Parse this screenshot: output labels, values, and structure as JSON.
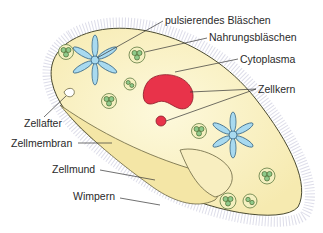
{
  "diagram": {
    "labels": {
      "pulsierendes_blaeschen": "pulsierendes Bläschen",
      "nahrungsblaeschen": "Nahrungsbläschen",
      "cytoplasma": "Cytoplasma",
      "zellkern": "Zellkern",
      "zellafter": "Zellafter",
      "zellmembran": "Zellmembran",
      "zellmund": "Zellmund",
      "wimpern": "Wimpern"
    },
    "colors": {
      "cytoplasm": "#fbf5c8",
      "nucleus": "#e8334a",
      "vacuole": "#a8daf0",
      "food_vacuole": "#8fc98a",
      "outline": "#5a5a3a",
      "cilia": "#c8c8dc"
    }
  }
}
